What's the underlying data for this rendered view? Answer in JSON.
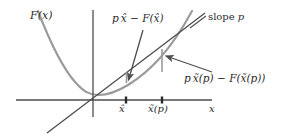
{
  "figure": {
    "labels": {
      "curve_label": "F(x)",
      "gap_small": "p x̂ − F(x̂)",
      "slope_label_text": "slope ",
      "slope_label_var": "p",
      "gap_large": "p x̃(p) − F(x̃(p))",
      "tick_xhat": "x̂",
      "tick_xtilde": "x̃(p)",
      "axis_x": "x"
    },
    "colors": {
      "curve": "#9a9a9a",
      "axis": "#4d4d4d",
      "tangent": "#4d4d4d",
      "gap_segment": "#9a9a9a",
      "arrow": "#4d4d4d",
      "text": "#2b2b2b",
      "background": "#ffffff"
    },
    "geometry": {
      "x_axis_y": 100,
      "x_axis_x_start": 16,
      "x_axis_x_end": 212,
      "y_axis_x": 93,
      "y_axis_y_top": 10,
      "y_axis_y_bottom": 117,
      "tick_xhat_x": 126,
      "tick_xtilde_x": 162,
      "tangent_from": [
        47,
        133
      ],
      "tangent_to": [
        205,
        13
      ],
      "gap_small_from": [
        126,
        73
      ],
      "gap_small_to": [
        126,
        83
      ],
      "gap_large_from": [
        162,
        50
      ],
      "gap_large_to": [
        162,
        72
      ]
    }
  }
}
